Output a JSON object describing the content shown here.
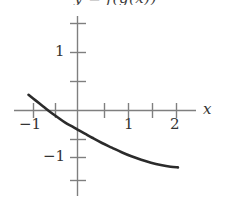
{
  "figure": {
    "title": "y = f(g(x))",
    "title_clipped": true,
    "background_color": "#ffffff",
    "axis_color": "#808080",
    "curve_color": "#2b2b2b",
    "text_color": "#333333"
  },
  "axis_labels": {
    "x": "x",
    "y": "y"
  },
  "x_tick_labels": [
    {
      "text": "−1",
      "value": -1
    },
    {
      "text": "1",
      "value": 1
    },
    {
      "text": "2",
      "value": 2
    }
  ],
  "y_tick_labels": [
    {
      "text": "1",
      "value": 1
    },
    {
      "text": "−1",
      "value": -1
    }
  ],
  "chart_data": {
    "type": "line",
    "title": "y = f(g(x))",
    "xlabel": "x",
    "ylabel": "y",
    "xlim": [
      -1.25,
      2.4
    ],
    "ylim": [
      -1.75,
      1.55
    ],
    "grid": false,
    "legend": null,
    "x_ticks": [
      -1,
      -0.5,
      0.5,
      1,
      1.5,
      2
    ],
    "x_tick_labels": [
      "−1",
      "",
      "",
      "1",
      "",
      "2"
    ],
    "y_ticks": [
      -1.5,
      -1,
      -0.5,
      0.5,
      1,
      1.5
    ],
    "y_tick_labels": [
      "",
      "−1",
      "",
      "",
      "1",
      ""
    ],
    "series": [
      {
        "name": "f(g(x))",
        "x": [
          -1.0,
          -0.85,
          -0.7,
          -0.55,
          -0.4,
          -0.25,
          -0.1,
          0.0,
          0.15,
          0.3,
          0.5,
          0.7,
          0.9,
          1.1,
          1.3,
          1.5,
          1.7,
          1.9,
          2.05
        ],
        "y": [
          0.27,
          0.17,
          0.07,
          -0.03,
          -0.12,
          -0.21,
          -0.28,
          -0.33,
          -0.4,
          -0.47,
          -0.56,
          -0.64,
          -0.72,
          -0.79,
          -0.85,
          -0.9,
          -0.94,
          -0.97,
          -0.98
        ]
      }
    ]
  }
}
